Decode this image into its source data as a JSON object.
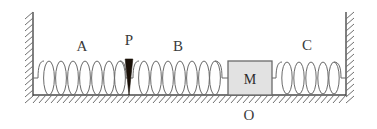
{
  "figure": {
    "background_color": "#ffffff",
    "width": 377,
    "height": 129
  },
  "labels": {
    "spring_a": "A",
    "pointer_p": "P",
    "spring_b": "B",
    "spring_c": "C",
    "block_m": "M",
    "origin_o": "O"
  },
  "colors": {
    "line": "#5a5a5a",
    "hatch": "#6f6f6f",
    "wall": "#4a4a4a",
    "text": "#3a3a3a",
    "block_fill": "#e2e2e2",
    "block_stroke": "#6a6a6a",
    "pointer_fill": "#1a1008"
  },
  "geometry": {
    "ground_y": 95,
    "left_wall_x": 33,
    "right_wall_x": 345,
    "wall_top_y": 12,
    "spring_axis_y": 78,
    "coil_half_height": 17
  },
  "elements": {
    "left_wall": {
      "name": "left-wall",
      "hatch_side": "left"
    },
    "right_wall": {
      "name": "right-wall",
      "hatch_side": "right"
    },
    "ground": {
      "name": "ground-surface",
      "hatch_side": "below"
    },
    "spring_a": {
      "coils": 7,
      "x_start": 38,
      "x_end": 124
    },
    "spring_b": {
      "coils": 7,
      "x_start": 134,
      "x_end": 222
    },
    "spring_c": {
      "coils": 5,
      "x_start": 272,
      "x_end": 344
    },
    "block": {
      "x": 228,
      "y": 61,
      "width": 44,
      "height": 34
    },
    "pointer": {
      "tip_x": 129,
      "tip_y": 95,
      "top_y": 60,
      "half_width": 4
    }
  }
}
